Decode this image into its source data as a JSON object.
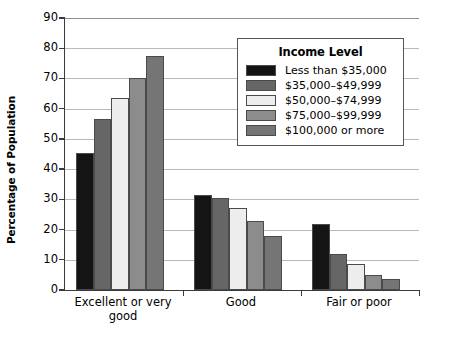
{
  "chart_data": {
    "type": "bar",
    "title": "",
    "xlabel": "",
    "ylabel": "Percentage of Population",
    "ylim": [
      0,
      90
    ],
    "ytick_step": 10,
    "yticks": [
      90,
      80,
      70,
      60,
      50,
      40,
      30,
      20,
      10,
      0
    ],
    "grid": true,
    "legend_position": "top-right-inside",
    "legend_title": "Income Level",
    "categories": [
      "Excellent or very good",
      "Good",
      "Fair or poor"
    ],
    "category_lines": [
      [
        "Excellent or very",
        "good"
      ],
      [
        "Good"
      ],
      [
        "Fair or poor"
      ]
    ],
    "series": [
      {
        "name": "Less than $35,000",
        "color": "#141414",
        "values": [
          45.5,
          31.5,
          22.0
        ]
      },
      {
        "name": "$35,000–$49,999",
        "color": "#666666",
        "values": [
          56.5,
          30.5,
          12.0
        ]
      },
      {
        "name": "$50,000–$74,999",
        "color": "#ededed",
        "values": [
          63.5,
          27.0,
          8.5
        ]
      },
      {
        "name": "$75,000–$99,999",
        "color": "#8c8c8c",
        "values": [
          70.0,
          23.0,
          5.0
        ]
      },
      {
        "name": "$100,000 or more",
        "color": "#757575",
        "values": [
          77.5,
          18.0,
          3.5
        ]
      }
    ]
  },
  "colors": {
    "axis": "#3a3a3a",
    "gridline": "#b8b8b8",
    "bar_outline": "#4a4a4a",
    "legend_border": "#555555",
    "background": "#ffffff"
  }
}
